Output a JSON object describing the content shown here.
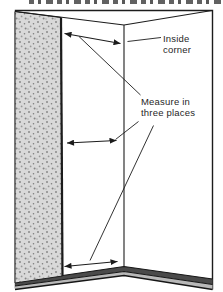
{
  "illustration": {
    "description_labels": {
      "inside_corner": "Inside\ncorner",
      "measure_three_places": "Measure in\nthree places"
    },
    "colors": {
      "line": "#1c1c1c",
      "panel_fill": "#d9d9d9",
      "panel_dot": "#8a8a8a",
      "baseboard_dark": "#4a4a4a",
      "floor_gray": "#b8b8b8",
      "text": "#1f1f1f",
      "background": "#ffffff"
    }
  }
}
